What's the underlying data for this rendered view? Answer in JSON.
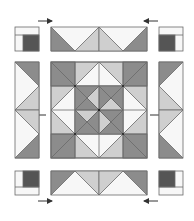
{
  "diagram": {
    "colors": {
      "background": "#ffffff",
      "outline": "#6a6a6a",
      "dark": "#8c8c8c",
      "darker": "#555555",
      "light": "#cfcfcf",
      "white": "#f7f7f7",
      "arrow": "#333333"
    },
    "parts": {
      "corner_units": [
        "top-left",
        "top-right",
        "bottom-left",
        "bottom-right"
      ],
      "border_strips": [
        "top",
        "bottom",
        "left",
        "right"
      ],
      "center_block": "square-in-square with pinwheel center"
    },
    "arrows": [
      {
        "position": "top-left",
        "direction": "right"
      },
      {
        "position": "top-right",
        "direction": "left"
      },
      {
        "position": "left",
        "direction": "left"
      },
      {
        "position": "right",
        "direction": "right"
      },
      {
        "position": "bottom-left",
        "direction": "right"
      },
      {
        "position": "bottom-right",
        "direction": "left"
      }
    ]
  }
}
